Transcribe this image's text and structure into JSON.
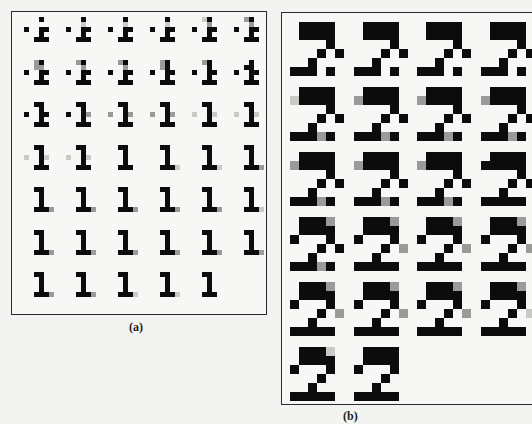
{
  "figure": {
    "panels": [
      {
        "id": "a",
        "caption": "(a)",
        "cell_px": 5,
        "origin": [
          24,
          17
        ],
        "col_step": 42,
        "row_step": 42.5,
        "columns": 6,
        "glyphs": [
          {
            "r": 0,
            "c": 0,
            "bitmap": [
              "...b...",
              ".......",
              "b..bb..",
              "...b...",
              "..bbb.."
            ]
          },
          {
            "r": 0,
            "c": 1,
            "bitmap": [
              "...b...",
              "...l...",
              "b..bb..",
              "...b...",
              "..bbb.."
            ]
          },
          {
            "r": 0,
            "c": 2,
            "bitmap": [
              "...b...",
              "...l...",
              "b..bb..",
              "...b...",
              "..bbb.."
            ]
          },
          {
            "r": 0,
            "c": 3,
            "bitmap": [
              "...b...",
              "...l...",
              "b..bb..",
              "...b...",
              "..bbb.."
            ]
          },
          {
            "r": 0,
            "c": 4,
            "bitmap": [
              "..lb...",
              "...g...",
              "b..bb..",
              "...b...",
              "..bbb.."
            ]
          },
          {
            "r": 0,
            "c": 5,
            "bitmap": [
              "..gb...",
              "...g...",
              "b..bb..",
              "...b...",
              "..bbb.."
            ]
          },
          {
            "r": 1,
            "c": 0,
            "bitmap": [
              "..gb...",
              "..gg...",
              "b..bb..",
              "...b...",
              "..bbb.."
            ]
          },
          {
            "r": 1,
            "c": 1,
            "bitmap": [
              "..gb...",
              "...g...",
              "b..bb..",
              "...b...",
              "..bbb.."
            ]
          },
          {
            "r": 1,
            "c": 2,
            "bitmap": [
              "..gb...",
              "...g...",
              "b..bb..",
              "...b...",
              "..bbb.."
            ]
          },
          {
            "r": 1,
            "c": 3,
            "bitmap": [
              "..gb...",
              "..gb...",
              "b..bb..",
              "...b...",
              "..bbb.."
            ]
          },
          {
            "r": 1,
            "c": 4,
            "bitmap": [
              "..gb...",
              "...b...",
              "b..bb..",
              "...b...",
              "..bbb.."
            ]
          },
          {
            "r": 1,
            "c": 5,
            "bitmap": [
              "...b...",
              "..bb...",
              "b..bb..",
              "...b...",
              "..bbb.."
            ]
          },
          {
            "r": 2,
            "c": 0,
            "bitmap": [
              "..bb...",
              "...b...",
              "b..bb..",
              "...b...",
              "..bbb.."
            ]
          },
          {
            "r": 2,
            "c": 1,
            "bitmap": [
              "..bb...",
              "...b...",
              "b..bg..",
              "...b...",
              "..bbb.."
            ]
          },
          {
            "r": 2,
            "c": 2,
            "bitmap": [
              "..bb...",
              "...b...",
              "g..bg..",
              "...b...",
              "..bbb.."
            ]
          },
          {
            "r": 2,
            "c": 3,
            "bitmap": [
              "..bb...",
              "...b...",
              "g..bg..",
              "...b...",
              "..bbb.."
            ]
          },
          {
            "r": 2,
            "c": 4,
            "bitmap": [
              "..bb...",
              "...b...",
              "l..bl..",
              "...b...",
              "..bbb.."
            ]
          },
          {
            "r": 2,
            "c": 5,
            "bitmap": [
              "..bb...",
              "...b...",
              "l..bl..",
              "...b...",
              "..bbb.."
            ]
          },
          {
            "r": 3,
            "c": 0,
            "bitmap": [
              "..bb...",
              "...b...",
              "l..bl..",
              "...b...",
              "..bbb.."
            ]
          },
          {
            "r": 3,
            "c": 1,
            "bitmap": [
              "..bb...",
              "...b...",
              "l..bl..",
              "...b...",
              "..bbb.."
            ]
          },
          {
            "r": 3,
            "c": 2,
            "bitmap": [
              "..bb...",
              "...b...",
              "...b...",
              "...b...",
              "..bbb.."
            ]
          },
          {
            "r": 3,
            "c": 3,
            "bitmap": [
              "..bb...",
              "...b...",
              "...b...",
              "...b...",
              "..bbbl."
            ]
          },
          {
            "r": 3,
            "c": 4,
            "bitmap": [
              "..bb...",
              "...b...",
              "...b...",
              "...b...",
              "..bbbl."
            ]
          },
          {
            "r": 3,
            "c": 5,
            "bitmap": [
              "..bb...",
              "...b...",
              "...b...",
              "...b...",
              "..bbbg."
            ]
          },
          {
            "r": 4,
            "c": 0,
            "bitmap": [
              "..bb...",
              "...b...",
              "...b...",
              "...b...",
              "..bbbg."
            ]
          },
          {
            "r": 4,
            "c": 1,
            "bitmap": [
              "..bb...",
              "...b...",
              "...b...",
              "...b...",
              "..bbbg."
            ]
          },
          {
            "r": 4,
            "c": 2,
            "bitmap": [
              "..bb...",
              "...b...",
              "...b...",
              "...b...",
              "..bbbg."
            ]
          },
          {
            "r": 4,
            "c": 3,
            "bitmap": [
              "..bb...",
              "...b...",
              "...b...",
              "...b...",
              "..bbbg."
            ]
          },
          {
            "r": 4,
            "c": 4,
            "bitmap": [
              "..bb...",
              "...b...",
              "...b...",
              "...b...",
              "..bbbg."
            ]
          },
          {
            "r": 4,
            "c": 5,
            "bitmap": [
              "..bb...",
              "...b...",
              "...b...",
              "...b...",
              "..bbbl."
            ]
          },
          {
            "r": 5,
            "c": 0,
            "bitmap": [
              "..bb...",
              "...b...",
              "...b...",
              "...b...",
              "..bbbg."
            ]
          },
          {
            "r": 5,
            "c": 1,
            "bitmap": [
              "..bb...",
              "...b...",
              "...b...",
              "...b...",
              "..bbbg."
            ]
          },
          {
            "r": 5,
            "c": 2,
            "bitmap": [
              "..bb...",
              "...b...",
              "...b...",
              "...b...",
              "..bbbg."
            ]
          },
          {
            "r": 5,
            "c": 3,
            "bitmap": [
              "..bb...",
              "...b...",
              "...b...",
              "...b...",
              "..bbbg."
            ]
          },
          {
            "r": 5,
            "c": 4,
            "bitmap": [
              "..bb...",
              "...b...",
              "...b...",
              "...b...",
              "..bbbg."
            ]
          },
          {
            "r": 5,
            "c": 5,
            "bitmap": [
              "..bb...",
              "...b...",
              "...b...",
              "...b...",
              "..bbbg."
            ]
          },
          {
            "r": 6,
            "c": 0,
            "bitmap": [
              "..bb...",
              "...b...",
              "...b...",
              "...b...",
              "..bbbg."
            ]
          },
          {
            "r": 6,
            "c": 1,
            "bitmap": [
              "..bb...",
              "...b...",
              "...b...",
              "...b...",
              "..bbbg."
            ]
          },
          {
            "r": 6,
            "c": 2,
            "bitmap": [
              "..bb...",
              "...b...",
              "...b...",
              "...b...",
              "..bbbl."
            ]
          },
          {
            "r": 6,
            "c": 3,
            "bitmap": [
              "..bb...",
              "...b...",
              "...b...",
              "...b...",
              "..bbbl."
            ]
          },
          {
            "r": 6,
            "c": 4,
            "bitmap": [
              "..bb...",
              "...b...",
              "...b...",
              "...b...",
              "..bbb.."
            ]
          }
        ]
      },
      {
        "id": "b",
        "caption": "(b)",
        "cell_px": 9,
        "origin": [
          290,
          22
        ],
        "col_step": 63.5,
        "row_step": 65,
        "columns": 4,
        "glyphs": [
          {
            "r": 0,
            "c": 0,
            "bitmap": [
              ".bbbb.",
              ".bbbb.",
              "....b.",
              "...b.b",
              "..b...",
              "bbb.b."
            ]
          },
          {
            "r": 0,
            "c": 1,
            "bitmap": [
              ".bbbb.",
              ".bbbb.",
              "....b.",
              "...b.b",
              "..b...",
              "bbb.b."
            ]
          },
          {
            "r": 0,
            "c": 2,
            "bitmap": [
              ".bbbb.",
              ".bbbb.",
              "....b.",
              "...b.b",
              "..b...",
              "bbb.b."
            ]
          },
          {
            "r": 0,
            "c": 3,
            "bitmap": [
              ".bbbb.",
              ".bbbb.",
              "....b.",
              "...b.b",
              "..b...",
              "bbb.b."
            ]
          },
          {
            "r": 1,
            "c": 0,
            "bitmap": [
              ".bbbb.",
              "lbbbb.",
              "....b.",
              "...b.b",
              "..b...",
              "bbbgb."
            ]
          },
          {
            "r": 1,
            "c": 1,
            "bitmap": [
              ".bbbb.",
              "gbbbb.",
              "....b.",
              "...b.b",
              "..b...",
              "bbbgb."
            ]
          },
          {
            "r": 1,
            "c": 2,
            "bitmap": [
              ".bbbb.",
              "gbbbb.",
              "....b.",
              "...b.b",
              "..b...",
              "bbbgb."
            ]
          },
          {
            "r": 1,
            "c": 3,
            "bitmap": [
              ".bbbb.",
              "gbbbb.",
              "....b.",
              "...b.b",
              "..b...",
              "bbbgb."
            ]
          },
          {
            "r": 2,
            "c": 0,
            "bitmap": [
              ".bbbb.",
              "gbbbb.",
              "....b.",
              "...b.b",
              "..b...",
              "bbbgb."
            ]
          },
          {
            "r": 2,
            "c": 1,
            "bitmap": [
              ".bbbb.",
              "gbbbb.",
              "....b.",
              "...b.b",
              "..b...",
              "bbbgb."
            ]
          },
          {
            "r": 2,
            "c": 2,
            "bitmap": [
              ".bbbb.",
              "gbbbb.",
              "....b.",
              "...b.b",
              "..b...",
              "bbbgb."
            ]
          },
          {
            "r": 2,
            "c": 3,
            "bitmap": [
              ".bbbb.",
              "bbbbb.",
              "....b.",
              "...b.b",
              "..b...",
              "bbbbb."
            ]
          },
          {
            "r": 3,
            "c": 0,
            "bitmap": [
              ".bbbg.",
              ".bbbb.",
              "b...b.",
              "...b.b",
              "..b...",
              "bbbgb."
            ]
          },
          {
            "r": 3,
            "c": 1,
            "bitmap": [
              ".bbbg.",
              ".bbbb.",
              "b...b.",
              "...b.g",
              "..b...",
              "bbbbb."
            ]
          },
          {
            "r": 3,
            "c": 2,
            "bitmap": [
              ".bbbg.",
              ".bbbb.",
              "b...b.",
              "...b.g",
              "..b...",
              "bbbbb."
            ]
          },
          {
            "r": 3,
            "c": 3,
            "bitmap": [
              ".bbbg.",
              ".bbbb.",
              "b...b.",
              "...b.g",
              "..b...",
              "bbbbb."
            ]
          },
          {
            "r": 4,
            "c": 0,
            "bitmap": [
              ".bbbg.",
              ".bbbb.",
              "b...b.",
              "...b.g",
              "..b...",
              "bbbbb."
            ]
          },
          {
            "r": 4,
            "c": 1,
            "bitmap": [
              ".bbbg.",
              ".bbbb.",
              "b...b.",
              "...b.g",
              "..b...",
              "bbbbb."
            ]
          },
          {
            "r": 4,
            "c": 2,
            "bitmap": [
              ".bbbg.",
              ".bbbb.",
              "b...b.",
              "...b.g",
              "..b...",
              "bbbbb."
            ]
          },
          {
            "r": 4,
            "c": 3,
            "bitmap": [
              ".bbbg.",
              ".bbbb.",
              "b...b.",
              "...b.l",
              "..b...",
              "bbbbb."
            ]
          },
          {
            "r": 5,
            "c": 0,
            "bitmap": [
              ".bbbl.",
              ".bbbb.",
              "b...b.",
              "...b..",
              "..b...",
              "bbbbb."
            ]
          },
          {
            "r": 5,
            "c": 1,
            "bitmap": [
              ".bbbb.",
              ".bbbb.",
              "b...b.",
              "...b..",
              "..b...",
              "bbbbb."
            ]
          }
        ]
      }
    ]
  }
}
